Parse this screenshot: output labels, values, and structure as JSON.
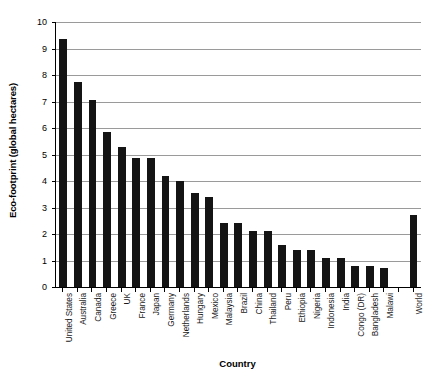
{
  "chart_data": {
    "type": "bar",
    "title": "",
    "xlabel": "Country",
    "ylabel": "Eco-footprint (global hectares)",
    "ylim": [
      0,
      10
    ],
    "ytick_labels": [
      "10",
      "9",
      "8",
      "7",
      "6",
      "5",
      "4",
      "3",
      "2",
      "1",
      "0"
    ],
    "ytick_values": [
      10,
      9,
      8,
      7,
      6,
      5,
      4,
      3,
      2,
      1,
      0
    ],
    "grid": "horizontal",
    "legend": "none",
    "bar_color": "#141414",
    "gridline_color": "#9a9a9a",
    "axis_color": "#000000",
    "categories": [
      "United States",
      "Australia",
      "Canada",
      "Greece",
      "UK",
      "France",
      "Japan",
      "Germany",
      "Netherlands",
      "Hungary",
      "Mexico",
      "Malaysia",
      "Brazil",
      "China",
      "Thailand",
      "Peru",
      "Ethiopia",
      "Nigeria",
      "Indonesia",
      "India",
      "Congo (DR)",
      "Bangladesh",
      "Malawi",
      "",
      "World"
    ],
    "values": [
      9.35,
      7.75,
      7.05,
      5.85,
      5.3,
      4.85,
      4.85,
      4.2,
      4.0,
      3.55,
      3.4,
      2.4,
      2.4,
      2.1,
      2.1,
      1.6,
      1.4,
      1.4,
      1.1,
      1.1,
      0.8,
      0.8,
      0.7,
      null,
      2.7
    ]
  }
}
